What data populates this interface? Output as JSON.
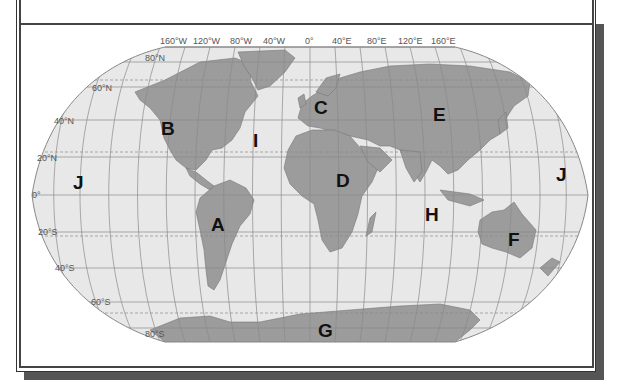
{
  "colors": {
    "ocean": "#e8e8e8",
    "land": "#9c9c9c",
    "grid": "#8a8a8a",
    "label": "#111111",
    "frame": "#444444",
    "shadow": "#555555"
  },
  "map": {
    "projection": "Robinson",
    "longitude_labels": [
      "160°W",
      "120°W",
      "80°W",
      "40°W",
      "0°",
      "40°E",
      "80°E",
      "120°E",
      "160°E"
    ],
    "latitude_labels": [
      "80°N",
      "60°N",
      "40°N",
      "20°N",
      "0°",
      "20°S",
      "40°S",
      "60°S",
      "80°S"
    ],
    "region_labels": [
      {
        "letter": "A",
        "region": "South America"
      },
      {
        "letter": "B",
        "region": "North America"
      },
      {
        "letter": "C",
        "region": "Europe"
      },
      {
        "letter": "D",
        "region": "Africa"
      },
      {
        "letter": "E",
        "region": "Asia"
      },
      {
        "letter": "F",
        "region": "Australia"
      },
      {
        "letter": "G",
        "region": "Antarctica"
      },
      {
        "letter": "H",
        "region": "Indian Ocean"
      },
      {
        "letter": "I",
        "region": "Atlantic Ocean"
      },
      {
        "letter": "J",
        "region": "Pacific Ocean (west)"
      },
      {
        "letter": "J",
        "region": "Pacific Ocean (east)"
      }
    ]
  }
}
